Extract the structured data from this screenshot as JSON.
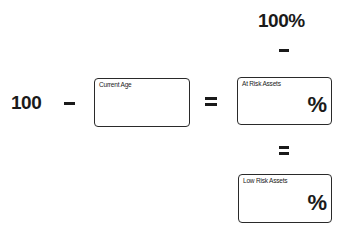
{
  "top_total": "100%",
  "left_constant": "100",
  "operators": {
    "minus": "–",
    "equals": "="
  },
  "boxes": {
    "current_age": {
      "label": "Current Age",
      "value": "",
      "suffix": ""
    },
    "at_risk_assets": {
      "label": "At Risk Assets",
      "value": "",
      "suffix": "%"
    },
    "low_risk_assets": {
      "label": "Low Risk Assets",
      "value": "",
      "suffix": "%"
    }
  }
}
